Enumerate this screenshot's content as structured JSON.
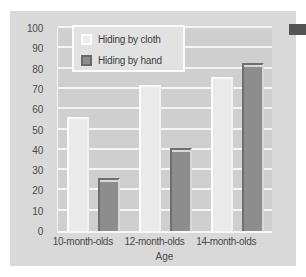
{
  "chart_data": {
    "type": "bar",
    "title": "",
    "xlabel": "Age",
    "ylabel": "Percent Successful",
    "categories": [
      "10-month-olds",
      "12-month-olds",
      "14-month-olds"
    ],
    "series": [
      {
        "name": "Hiding by cloth",
        "values": [
          56,
          72,
          76
        ],
        "color": "#eaeaea"
      },
      {
        "name": "Hiding by hand",
        "values": [
          26,
          41,
          83
        ],
        "color": "#8d8d8d"
      }
    ],
    "ylim": [
      0,
      100
    ],
    "yticks": [
      0,
      10,
      20,
      30,
      40,
      50,
      60,
      70,
      80,
      90,
      100
    ],
    "ytick_labels": [
      "0",
      "10",
      "20",
      "30",
      "40",
      "50",
      "60",
      "70",
      "80",
      "90",
      "100"
    ],
    "grid": true,
    "grid_axis": "y",
    "legend_position": "upper left",
    "panel_background": "#d9d9d9",
    "plot_background": "#cfcfcf",
    "gridline_color": "#f4f4f4"
  },
  "legend": {
    "items": [
      {
        "label": "Hiding by cloth",
        "swatch": "cloth"
      },
      {
        "label": "Hiding by hand",
        "swatch": "hand"
      }
    ]
  },
  "edge_marker": {
    "name": "edge-marker",
    "color": "#555555"
  }
}
